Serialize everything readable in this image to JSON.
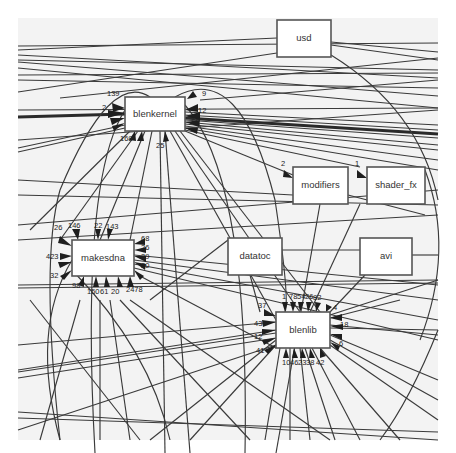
{
  "diagram": {
    "type": "dependency-graph",
    "nodes": [
      {
        "id": "usd",
        "label": "usd",
        "x": 277,
        "y": 20,
        "w": 54,
        "h": 37
      },
      {
        "id": "blenkernel",
        "label": "blenkernel",
        "x": 125,
        "y": 97,
        "w": 60,
        "h": 34
      },
      {
        "id": "modifiers",
        "label": "modifiers",
        "x": 293,
        "y": 167,
        "w": 55,
        "h": 37
      },
      {
        "id": "shader_fx",
        "label": "shader_fx",
        "x": 367,
        "y": 167,
        "w": 58,
        "h": 37
      },
      {
        "id": "makesdna",
        "label": "makesdna",
        "x": 72,
        "y": 240,
        "w": 62,
        "h": 36
      },
      {
        "id": "datatoc",
        "label": "datatoc",
        "x": 228,
        "y": 238,
        "w": 54,
        "h": 37
      },
      {
        "id": "avi",
        "label": "avi",
        "x": 360,
        "y": 238,
        "w": 52,
        "h": 37
      },
      {
        "id": "blenlib",
        "label": "blenlib",
        "x": 276,
        "y": 312,
        "w": 54,
        "h": 36
      }
    ],
    "edge_labels": [
      {
        "node": "blenkernel",
        "text": "139",
        "x": 107,
        "y": 96
      },
      {
        "node": "blenkernel",
        "text": "2",
        "x": 102,
        "y": 110
      },
      {
        "node": "blenkernel",
        "text": "9",
        "x": 202,
        "y": 96
      },
      {
        "node": "blenkernel",
        "text": "12",
        "x": 198,
        "y": 113
      },
      {
        "node": "blenkernel",
        "text": "168",
        "x": 122,
        "y": 141
      },
      {
        "node": "blenkernel",
        "text": "25",
        "x": 158,
        "y": 147
      },
      {
        "node": "modifiers",
        "text": "2",
        "x": 282,
        "y": 163
      },
      {
        "node": "shader_fx",
        "text": "1",
        "x": 356,
        "y": 163
      },
      {
        "node": "makesdna",
        "text": "26",
        "x": 56,
        "y": 228
      },
      {
        "node": "makesdna",
        "text": "146",
        "x": 70,
        "y": 228
      },
      {
        "node": "makesdna",
        "text": "22",
        "x": 95,
        "y": 228
      },
      {
        "node": "makesdna",
        "text": "143",
        "x": 108,
        "y": 228
      },
      {
        "node": "makesdna",
        "text": "68",
        "x": 141,
        "y": 240
      },
      {
        "node": "makesdna",
        "text": "26",
        "x": 141,
        "y": 249
      },
      {
        "node": "makesdna",
        "text": "39",
        "x": 141,
        "y": 258
      },
      {
        "node": "makesdna",
        "text": "20",
        "x": 141,
        "y": 267
      },
      {
        "node": "makesdna",
        "text": "423",
        "x": 47,
        "y": 258
      },
      {
        "node": "makesdna",
        "text": "32",
        "x": 50,
        "y": 277
      },
      {
        "node": "makesdna",
        "text": "98",
        "x": 74,
        "y": 287
      },
      {
        "node": "makesdna",
        "text": "150",
        "x": 90,
        "y": 292
      },
      {
        "node": "makesdna",
        "text": "61",
        "x": 101,
        "y": 292
      },
      {
        "node": "makesdna",
        "text": "20",
        "x": 112,
        "y": 292
      },
      {
        "node": "makesdna",
        "text": "2478",
        "x": 128,
        "y": 290
      },
      {
        "node": "blenlib",
        "text": "1",
        "x": 284,
        "y": 299
      },
      {
        "node": "blenlib",
        "text": "78",
        "x": 291,
        "y": 299
      },
      {
        "node": "blenlib",
        "text": "54",
        "x": 299,
        "y": 299
      },
      {
        "node": "blenlib",
        "text": "26",
        "x": 307,
        "y": 299
      },
      {
        "node": "blenlib",
        "text": "82",
        "x": 315,
        "y": 299
      },
      {
        "node": "blenlib",
        "text": "4",
        "x": 333,
        "y": 309
      },
      {
        "node": "blenlib",
        "text": "37",
        "x": 260,
        "y": 306
      },
      {
        "node": "blenlib",
        "text": "43",
        "x": 255,
        "y": 325
      },
      {
        "node": "blenlib",
        "text": "12",
        "x": 255,
        "y": 338
      },
      {
        "node": "blenlib",
        "text": "41",
        "x": 257,
        "y": 352
      },
      {
        "node": "blenlib",
        "text": "18",
        "x": 340,
        "y": 326
      },
      {
        "node": "blenlib",
        "text": "6",
        "x": 338,
        "y": 345
      },
      {
        "node": "blenlib",
        "text": "10",
        "x": 284,
        "y": 363
      },
      {
        "node": "blenlib",
        "text": "46",
        "x": 292,
        "y": 363
      },
      {
        "node": "blenlib",
        "text": "23",
        "x": 300,
        "y": 363
      },
      {
        "node": "blenlib",
        "text": "38",
        "x": 308,
        "y": 363
      },
      {
        "node": "blenlib",
        "text": "42",
        "x": 318,
        "y": 363
      }
    ],
    "colors": {
      "background": "#f3f3f3",
      "node_fill": "#ffffff",
      "node_stroke": "#555555",
      "edge": "#3a3a3a",
      "text": "#333333"
    }
  }
}
